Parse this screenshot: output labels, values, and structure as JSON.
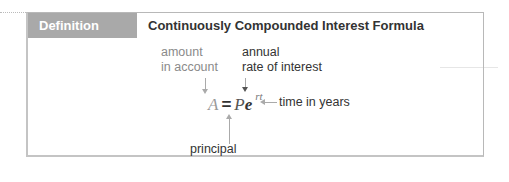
{
  "header": {
    "tag_label": "Definition",
    "title": "Continuously Compounded Interest Formula"
  },
  "formula": {
    "A": "A",
    "equals": "=",
    "P": "P",
    "e": "e",
    "exponent": "rt"
  },
  "annotations": {
    "amount_line1": "amount",
    "amount_line2": "in account",
    "rate_line1": "annual",
    "rate_line2": "rate of interest",
    "time": "time in years",
    "principal": "principal"
  }
}
